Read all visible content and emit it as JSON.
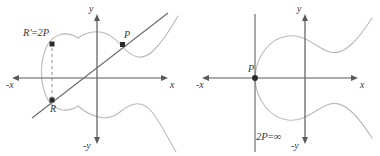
{
  "figure": {
    "colors": {
      "curve": "#b9b9b9",
      "axis": "#5a5a5a",
      "line": "#6e6e6e",
      "dashed": "#8c8c8c",
      "point": "#2b2b2b",
      "text": "#3a3a3a",
      "background": "#ffffff"
    }
  },
  "panels": [
    {
      "id": "left",
      "name": "doubling-generic-case",
      "axes": {
        "x_positive_label": "x",
        "x_negative_label": "-x",
        "y_positive_label": "y",
        "y_negative_label": "-y"
      },
      "points": [
        {
          "id": "P",
          "label": "P",
          "x": 123,
          "y": 45
        },
        {
          "id": "R",
          "label": "R",
          "x": 52,
          "y": 100
        },
        {
          "id": "Rp",
          "label": "R' = 2P",
          "label_lhs": "R'",
          "label_op": "=",
          "label_rhs": "2P",
          "x": 52,
          "y": 44
        }
      ],
      "annotations": {
        "tangent_line": "tangent line through P meeting curve at R",
        "reflection": "vertical dashed reflection from R to R' = 2P"
      }
    },
    {
      "id": "right",
      "name": "doubling-degenerate-case",
      "axes": {
        "x_positive_label": "x",
        "x_negative_label": "-x",
        "y_positive_label": "y",
        "y_negative_label": "-y"
      },
      "points": [
        {
          "id": "P",
          "label": "P",
          "x": 255,
          "y": 78
        }
      ],
      "annotations": {
        "result_label": "2P = ∞",
        "result_lhs": "2P",
        "result_op": "=",
        "result_rhs": "∞",
        "tangent_line": "vertical tangent at P"
      }
    }
  ]
}
